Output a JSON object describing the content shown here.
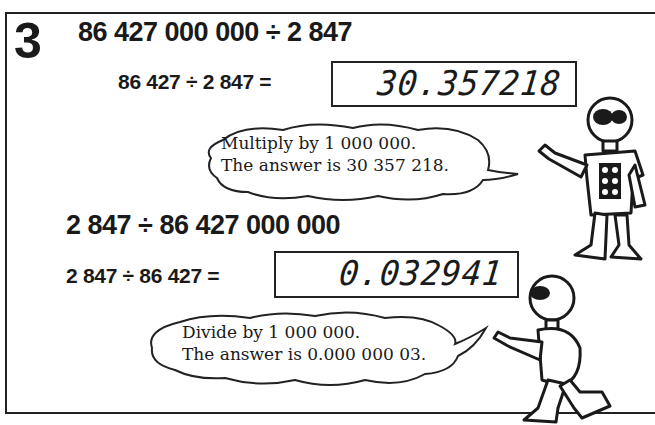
{
  "section_number": "3",
  "problem1": {
    "heading": "86 427 000 000 ÷ 2 847",
    "equation": "86 427 ÷ 2 847 =",
    "display": "30.357218",
    "speech": [
      "Multiply by 1 000 000.",
      "The answer is 30 357 218."
    ]
  },
  "problem2": {
    "heading": "2 847 ÷ 86 427 000 000",
    "equation": "2 847 ÷ 86 427 =",
    "display": "0.032941",
    "speech": [
      "Divide by 1 000 000.",
      "The answer is 0.000 000 03."
    ]
  },
  "colors": {
    "ink": "#1a1a1a",
    "background": "#ffffff"
  }
}
